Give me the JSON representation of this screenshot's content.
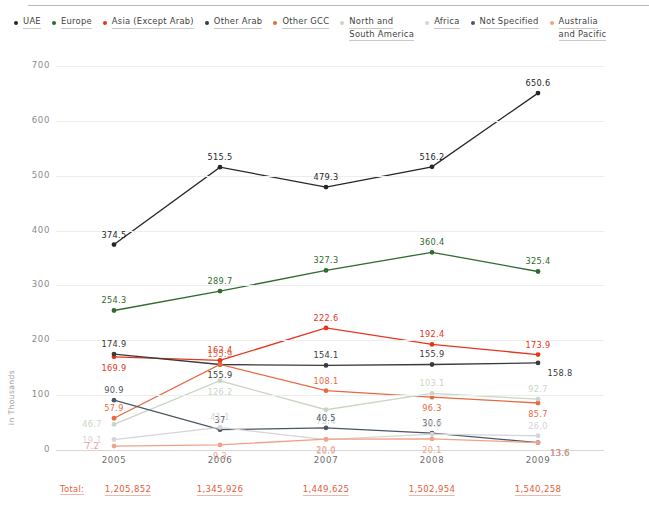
{
  "legend": {
    "items": [
      {
        "label": "UAE",
        "color": "#262626",
        "lines": [
          "UAE"
        ]
      },
      {
        "label": "Europe",
        "color": "#2f6b2f",
        "lines": [
          "Europe"
        ]
      },
      {
        "label": "Asia (Except Arab)",
        "color": "#e8341c",
        "lines": [
          "Asia (Except Arab)"
        ]
      },
      {
        "label": "Other Arab",
        "color": "#3a3a3a",
        "lines": [
          "Other Arab"
        ]
      },
      {
        "label": "Other GCC",
        "color": "#e8693e",
        "lines": [
          "Other GCC"
        ]
      },
      {
        "label": "North and South America",
        "color": "#c8d6c4",
        "lines": [
          "North and",
          "South America"
        ]
      },
      {
        "label": "Africa",
        "color": "#d7d3d8",
        "lines": [
          "Africa"
        ]
      },
      {
        "label": "Not Specified",
        "color": "#4b5763",
        "lines": [
          "Not Specified"
        ]
      },
      {
        "label": "Australia and Pacific",
        "color": "#f0a286",
        "lines": [
          "Australia",
          "and Pacific"
        ]
      }
    ]
  },
  "axis": {
    "y_title": "in Thousands",
    "y_ticks": [
      "700",
      "600",
      "500",
      "400",
      "300",
      "200",
      "100",
      "0"
    ],
    "x_ticks": [
      "2005",
      "2006",
      "2007",
      "2008",
      "2009"
    ]
  },
  "totals": {
    "word": "Total:",
    "values": [
      "1,205,852",
      "1,345,926",
      "1,449,625",
      "1,502,954",
      "1,540,258"
    ]
  },
  "chart_data": {
    "type": "line",
    "title": "",
    "xlabel": "",
    "ylabel": "in Thousands",
    "ylim": [
      0,
      700
    ],
    "grid": true,
    "legend_position": "top",
    "categories": [
      "2005",
      "2006",
      "2007",
      "2008",
      "2009"
    ],
    "series": [
      {
        "name": "Other Arab",
        "color": "#262626",
        "values": [
          374.5,
          515.5,
          479.3,
          516.2,
          650.6
        ],
        "labels": [
          "374.5",
          "515.5",
          "479.3",
          "516.2",
          "650.6"
        ]
      },
      {
        "name": "Europe",
        "color": "#2f6b2f",
        "values": [
          254.3,
          289.7,
          327.3,
          360.4,
          325.4
        ],
        "labels": [
          "254.3",
          "289.7",
          "327.3",
          "360.4",
          "325.4"
        ]
      },
      {
        "name": "Asia (Except Arab)",
        "color": "#e8341c",
        "values": [
          169.9,
          163.4,
          222.6,
          192.4,
          173.9
        ],
        "labels": [
          "169.9",
          "163.4",
          "222.6",
          "192.4",
          "173.9"
        ]
      },
      {
        "name": "UAE",
        "color": "#3a3a3a",
        "values": [
          174.9,
          155.9,
          154.1,
          155.9,
          158.8
        ],
        "labels": [
          "174.9",
          "155.9",
          "154.1",
          "155.9",
          "158.8"
        ]
      },
      {
        "name": "Other GCC",
        "color": "#e8693e",
        "values": [
          57.9,
          155.9,
          108.1,
          96.3,
          85.7
        ],
        "labels": [
          "57.9",
          "155.9",
          "108.1",
          "96.3",
          "85.7"
        ]
      },
      {
        "name": "North and South America",
        "color": "#c8d6c4",
        "values": [
          46.7,
          126.2,
          73.4,
          103.1,
          92.7
        ],
        "labels": [
          "46.7",
          "126.2",
          "73.4",
          "103.1",
          "92.7"
        ]
      },
      {
        "name": "Not Specified",
        "color": "#4b5763",
        "values": [
          90.9,
          37.0,
          40.5,
          30.6,
          13.6
        ],
        "labels": [
          "90.9",
          "37",
          "40.5",
          "30.6",
          "13.6"
        ]
      },
      {
        "name": "Africa",
        "color": "#d7d3d8",
        "values": [
          19.1,
          41.1,
          18.9,
          28.9,
          26.0
        ],
        "labels": [
          "19.1",
          "41.1",
          "18.9",
          "28.9",
          "26.0"
        ]
      },
      {
        "name": "Australia and Pacific",
        "color": "#f0a286",
        "values": [
          7.2,
          9.3,
          20.0,
          20.1,
          13.6
        ],
        "labels": [
          "7.2",
          "9.3",
          "20.0",
          "20.1",
          "13.6"
        ]
      }
    ],
    "point_label_offsets": [
      {
        "series": "Other Arab",
        "dy": [
          -10,
          -10,
          -10,
          -10,
          -10
        ],
        "dx": [
          0,
          0,
          0,
          0,
          0
        ]
      },
      {
        "series": "Europe",
        "dy": [
          -10,
          -10,
          -10,
          -10,
          -10
        ],
        "dx": [
          0,
          0,
          0,
          0,
          0
        ]
      },
      {
        "series": "Asia (Except Arab)",
        "dy": [
          11,
          -10,
          -10,
          -10,
          -10
        ],
        "dx": [
          0,
          0,
          0,
          0,
          0
        ]
      },
      {
        "series": "UAE",
        "dy": [
          -10,
          11,
          -10,
          -10,
          10
        ],
        "dx": [
          0,
          0,
          0,
          0,
          22
        ]
      },
      {
        "series": "Other GCC",
        "dy": [
          -10,
          -10,
          -10,
          11,
          11
        ],
        "dx": [
          0,
          0,
          0,
          0,
          0
        ]
      },
      {
        "series": "North and South America",
        "dy": [
          0,
          11,
          11,
          -10,
          -10
        ],
        "dx": [
          -22,
          0,
          0,
          0,
          0
        ]
      },
      {
        "series": "Not Specified",
        "dy": [
          -10,
          -10,
          -10,
          -10,
          10
        ],
        "dx": [
          0,
          0,
          0,
          0,
          22
        ]
      },
      {
        "series": "Africa",
        "dy": [
          0,
          -10,
          11,
          -10,
          -10
        ],
        "dx": [
          -22,
          0,
          0,
          0,
          0
        ]
      },
      {
        "series": "Australia and Pacific",
        "dy": [
          0,
          11,
          11,
          11,
          10
        ],
        "dx": [
          -22,
          0,
          0,
          0,
          22
        ]
      }
    ]
  }
}
